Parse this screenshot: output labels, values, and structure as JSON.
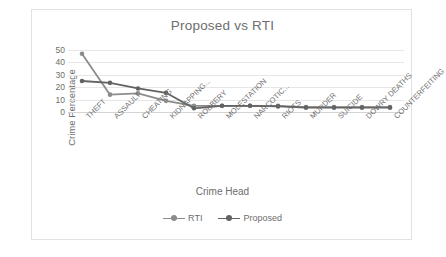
{
  "chart_data": {
    "type": "line",
    "title": "Proposed vs RTI",
    "xlabel": "Crime Head",
    "ylabel": "Crime Percentage",
    "ylim": [
      0,
      50
    ],
    "yticks": [
      0,
      10,
      20,
      30,
      40,
      50
    ],
    "grid": true,
    "legend_position": "bottom",
    "categories": [
      "THEFT",
      "ASSAULT",
      "CHEATING",
      "KIDNAPPING...",
      "ROBBERY",
      "MOLESTATION",
      "NARCOTIC...",
      "RIOTS",
      "MURDER",
      "SUICIDE",
      "DOWRY DEATHS",
      "COUNTERFEITING"
    ],
    "series": [
      {
        "name": "RTI",
        "color": "#8c8c8c",
        "values": [
          47,
          14,
          15,
          9,
          5,
          5,
          5,
          5,
          4,
          4,
          4,
          4
        ]
      },
      {
        "name": "Proposed",
        "color": "#636363",
        "values": [
          25,
          23.5,
          19,
          15.5,
          3,
          5,
          5,
          4.5,
          3.5,
          3.5,
          3.5,
          3.5
        ]
      }
    ]
  },
  "legend": {
    "items": [
      {
        "label": "RTI"
      },
      {
        "label": "Proposed"
      }
    ]
  },
  "colors": {
    "grid": "#e6e6e6",
    "axis": "#d4d4d4",
    "text": "#6d6d6d",
    "border": "#e2e2e2"
  }
}
